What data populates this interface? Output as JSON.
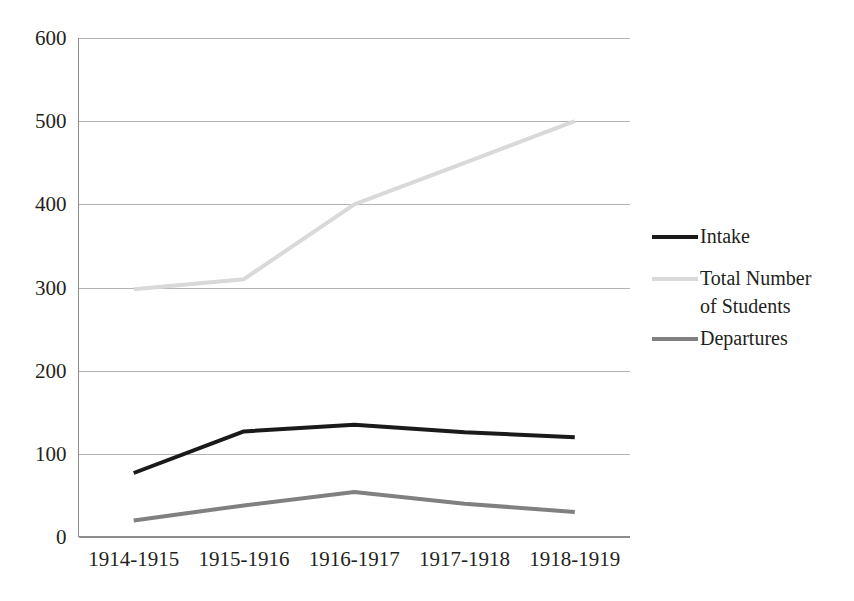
{
  "chart_data": {
    "type": "line",
    "title": "",
    "subtitle": "",
    "xlabel": "",
    "ylabel": "",
    "categories": [
      "1914-1915",
      "1915-1916",
      "1916-1917",
      "1917-1918",
      "1918-1919"
    ],
    "series": [
      {
        "name": "Intake",
        "values": [
          77,
          127,
          135,
          126,
          120
        ],
        "color": "#1a1a1a",
        "width": 4
      },
      {
        "name": "Total Number of Students",
        "values": [
          298,
          310,
          400,
          450,
          500
        ],
        "color": "#d9d9d9",
        "width": 4
      },
      {
        "name": "Departures",
        "values": [
          20,
          38,
          54,
          40,
          30
        ],
        "color": "#808080",
        "width": 4
      }
    ],
    "ylim": [
      0,
      600
    ],
    "yticks": [
      0,
      100,
      200,
      300,
      400,
      500,
      600
    ],
    "ytick_labels": [
      "0",
      "100",
      "200",
      "300",
      "400",
      "500",
      "600"
    ],
    "grid": true,
    "grid_color": "#b3b3b3",
    "legend_position": "right",
    "background": "#ffffff"
  },
  "legend": {
    "entries": [
      {
        "label": "Intake",
        "line1": "Intake",
        "line2": ""
      },
      {
        "label": "Total Number of Students",
        "line1": "Total Number",
        "line2": "of Students"
      },
      {
        "label": "Departures",
        "line1": "Departures",
        "line2": ""
      }
    ]
  }
}
